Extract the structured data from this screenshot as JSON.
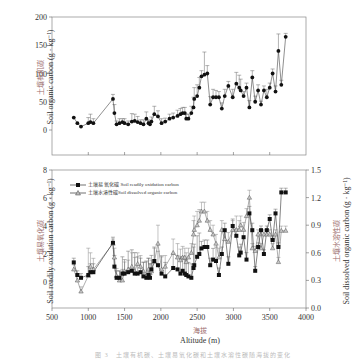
{
  "chart_data": [
    {
      "type": "line",
      "panel": "top",
      "title": "",
      "xlabel": "",
      "ylabel_cn": "土壤有机碳",
      "ylabel_en": "Soil organic carbon (g · kg⁻¹)",
      "xlim": [
        500,
        4000
      ],
      "ylim": [
        -45,
        200
      ],
      "yticks": [
        0,
        50,
        100,
        150,
        200
      ],
      "grid": false,
      "series": [
        {
          "name": "Soil organic carbon",
          "marker": "circle",
          "x": [
            800,
            850,
            900,
            1000,
            1030,
            1070,
            1340,
            1360,
            1390,
            1430,
            1470,
            1500,
            1550,
            1600,
            1640,
            1680,
            1720,
            1760,
            1800,
            1830,
            1850,
            1870,
            1910,
            1960,
            2010,
            2060,
            2120,
            2170,
            2230,
            2270,
            2300,
            2330,
            2350,
            2380,
            2420,
            2450,
            2460,
            2500,
            2530,
            2560,
            2600,
            2640,
            2680,
            2720,
            2760,
            2800,
            2840,
            2880,
            2930,
            2990,
            3040,
            3080,
            3100,
            3140,
            3180,
            3220,
            3260,
            3300,
            3340,
            3380,
            3420,
            3460,
            3500,
            3540,
            3580,
            3620,
            3660,
            3720
          ],
          "y": [
            22,
            12,
            6,
            12,
            14,
            12,
            55,
            30,
            10,
            12,
            14,
            12,
            10,
            15,
            16,
            14,
            12,
            10,
            20,
            12,
            10,
            15,
            28,
            24,
            12,
            15,
            20,
            22,
            25,
            28,
            30,
            30,
            20,
            20,
            30,
            40,
            55,
            60,
            75,
            95,
            98,
            100,
            45,
            58,
            58,
            58,
            38,
            60,
            78,
            58,
            82,
            75,
            70,
            60,
            75,
            40,
            93,
            50,
            70,
            45,
            70,
            58,
            75,
            100,
            68,
            140,
            80,
            165
          ],
          "error_plus": [
            0,
            0,
            0,
            10,
            14,
            8,
            8,
            15,
            6,
            8,
            6,
            8,
            6,
            14,
            12,
            10,
            6,
            8,
            12,
            6,
            6,
            8,
            14,
            10,
            8,
            6,
            8,
            8,
            10,
            10,
            10,
            10,
            8,
            8,
            12,
            18,
            20,
            20,
            18,
            10,
            40,
            14,
            14,
            14,
            12,
            10,
            10,
            12,
            8,
            14,
            20,
            22,
            20,
            8,
            8,
            12,
            12,
            10,
            10,
            6,
            8,
            14,
            8,
            8,
            10,
            30,
            8,
            6
          ]
        }
      ]
    },
    {
      "type": "line",
      "panel": "bottom",
      "title": "",
      "xlabel_cn": "海拔",
      "xlabel_en": "Altitude (m)",
      "ylabel_left_cn": "土壤易氧化碳",
      "ylabel_left_en": "Soil readily oxidation carbon (g · kg⁻¹)",
      "ylabel_right_cn": "土壤水溶性碳",
      "ylabel_right_en": "Soil dissolved organic carbon (g · kg⁻¹)",
      "xlim": [
        500,
        4000
      ],
      "xticks": [
        500,
        1000,
        1500,
        2000,
        2500,
        3000,
        3500,
        4000
      ],
      "ylim_left": [
        -2,
        8
      ],
      "yticks_left": [
        0,
        2,
        4,
        6,
        8
      ],
      "ylim_right": [
        0,
        1.5
      ],
      "yticks_right": [
        0.0,
        0.3,
        0.6,
        0.9,
        1.2,
        1.5
      ],
      "grid": false,
      "legend_position": "upper left",
      "series": [
        {
          "name": "土壤易氧化碳 Soil readily oxidation carbon",
          "axis": "left",
          "marker": "square",
          "x": [
            800,
            850,
            900,
            1000,
            1030,
            1070,
            1340,
            1360,
            1390,
            1430,
            1470,
            1500,
            1550,
            1600,
            1640,
            1680,
            1720,
            1760,
            1800,
            1830,
            1850,
            1870,
            1910,
            1960,
            2010,
            2060,
            2170,
            2230,
            2270,
            2300,
            2330,
            2350,
            2380,
            2420,
            2450,
            2460,
            2500,
            2530,
            2560,
            2600,
            2640,
            2680,
            2720,
            2760,
            2800,
            2840,
            2880,
            2930,
            2990,
            3040,
            3080,
            3100,
            3140,
            3180,
            3220,
            3260,
            3300,
            3340,
            3380,
            3420,
            3460,
            3500,
            3540,
            3580,
            3620,
            3660,
            3720
          ],
          "y": [
            1.4,
            0.5,
            0.3,
            0.5,
            0.7,
            0.7,
            2.8,
            1.1,
            0.3,
            0.3,
            0.6,
            0.6,
            0.7,
            0.8,
            0.6,
            0.6,
            0.7,
            0.4,
            0.3,
            0.5,
            0.3,
            0.9,
            1.5,
            1.2,
            0.6,
            0.4,
            1.0,
            0.9,
            0.6,
            0.8,
            0.6,
            0.5,
            0.4,
            0.3,
            1.0,
            1.2,
            1.8,
            2.0,
            2.4,
            2.5,
            2.5,
            1.2,
            1.6,
            1.5,
            0.5,
            2.0,
            3.7,
            1.3,
            4.0,
            3.3,
            1.9,
            2.1,
            3.2,
            1.6,
            4.9,
            3.7,
            0.8,
            2.5,
            3.7,
            2.0,
            3.7,
            4.5,
            3.0,
            4.9,
            2.5,
            6.4,
            6.4
          ],
          "error_plus": [
            0.3,
            0.3,
            0.3,
            0.6,
            0.6,
            0.6,
            0.4,
            0.8,
            0.5,
            0.5,
            1.2,
            1.0,
            1.5,
            1.5,
            1.5,
            1.2,
            1.0,
            1.0,
            1.2,
            1.2,
            1.0,
            1.0,
            1.0,
            1.0,
            1.2,
            1.0,
            1.0,
            1.0,
            1.2,
            1.0,
            1.0,
            1.0,
            1.0,
            1.0,
            1.5,
            1.5,
            1.5,
            1.5,
            0.5,
            0.5,
            0.5,
            0.5,
            0.8,
            1.0,
            0.5,
            0.5,
            0.5,
            0.5,
            0.5,
            0.5,
            0.6,
            0.6,
            0.5,
            0.5,
            0.5,
            0.5,
            0.3,
            0.3,
            0.3,
            0.3,
            0.3,
            0.3,
            0.3,
            0.3,
            0.3,
            0.3,
            0.3
          ]
        },
        {
          "name": "土壤水溶性碳 Soil dissolved organic carbon",
          "axis": "right",
          "marker": "triangle",
          "x": [
            800,
            850,
            900,
            1000,
            1030,
            1070,
            1340,
            1360,
            1390,
            1430,
            1470,
            1500,
            1550,
            1600,
            1640,
            1680,
            1720,
            1760,
            1800,
            1830,
            1850,
            1870,
            1910,
            1960,
            2010,
            2060,
            2170,
            2230,
            2270,
            2300,
            2330,
            2350,
            2380,
            2420,
            2450,
            2460,
            2500,
            2530,
            2560,
            2600,
            2640,
            2680,
            2720,
            2760,
            2800,
            2840,
            2880,
            2930,
            2990,
            3040,
            3080,
            3100,
            3140,
            3180,
            3220,
            3260,
            3300,
            3340,
            3380,
            3420,
            3460,
            3500,
            3540,
            3580,
            3620,
            3660,
            3720
          ],
          "y": [
            0.42,
            0.3,
            0.18,
            0.35,
            0.45,
            0.42,
            0.7,
            0.55,
            0.35,
            0.3,
            0.3,
            0.4,
            0.42,
            0.45,
            0.4,
            0.48,
            0.45,
            0.4,
            0.35,
            0.42,
            0.38,
            0.4,
            0.5,
            0.7,
            0.42,
            0.45,
            0.6,
            0.55,
            0.52,
            0.55,
            0.55,
            0.5,
            0.55,
            0.6,
            0.8,
            0.85,
            0.9,
            0.95,
            1.05,
            1.05,
            0.95,
            0.85,
            0.8,
            0.7,
            0.55,
            0.85,
            0.75,
            0.72,
            0.85,
            0.85,
            0.85,
            0.9,
            0.85,
            1.0,
            1.2,
            0.65,
            0.62,
            0.8,
            0.65,
            0.8,
            0.8,
            0.8,
            0.65,
            0.8,
            0.5,
            0.84,
            0.84
          ],
          "error_plus": [
            0.05,
            0.05,
            0.05,
            0.3,
            0.15,
            0.12,
            0.05,
            0.1,
            0.08,
            0.1,
            0.12,
            0.1,
            0.1,
            0.15,
            0.15,
            0.12,
            0.12,
            0.1,
            0.15,
            0.12,
            0.1,
            0.12,
            0.15,
            0.2,
            0.15,
            0.12,
            0.15,
            0.15,
            0.12,
            0.12,
            0.1,
            0.1,
            0.1,
            0.1,
            0.15,
            0.15,
            0.15,
            0.12,
            0.1,
            0.1,
            0.1,
            0.1,
            0.1,
            0.1,
            0.1,
            0.1,
            0.1,
            0.1,
            0.1,
            0.15,
            0.1,
            0.1,
            0.08,
            0.08,
            0.08,
            0.05,
            0.05,
            0.05,
            0.05,
            0.05,
            0.05,
            0.05,
            0.05,
            0.05,
            0.05,
            0.05,
            0.05
          ]
        }
      ]
    }
  ],
  "top_panel": {
    "yticks": [
      "200",
      "150",
      "100",
      "50",
      "0"
    ],
    "ylabel_cn": "土壤有机碳",
    "ylabel_en": "Soil organic carbon (g · kg⁻¹)"
  },
  "bottom_panel": {
    "yticks_left": [
      "8",
      "6",
      "4",
      "2",
      "0"
    ],
    "yticks_right": [
      "1.5",
      "1.2",
      "0.9",
      "0.6",
      "0.3",
      "0.0"
    ],
    "xticks": [
      "500",
      "1000",
      "1500",
      "2000",
      "2500",
      "3000",
      "3500",
      "4000"
    ],
    "ylabel_left_cn": "土壤易氧化碳",
    "ylabel_left_en": "Soil readily oxidation carbon (g · kg⁻¹)",
    "ylabel_right_cn": "土壤水溶性碳",
    "ylabel_right_en": "Soil dissolved organic carbon (g · kg⁻¹)",
    "legend": [
      "土壤易 氧化碳 Soil readily oxidation carbon",
      "土壤水溶性碳Soil dissolved organic carbon"
    ],
    "xlabel_cn": "海拔",
    "xlabel_en": "Altitude (m)"
  },
  "caption": "图 3　土壤有机碳、土壤易氧化碳和土壤水溶性碳随海拔的变化"
}
